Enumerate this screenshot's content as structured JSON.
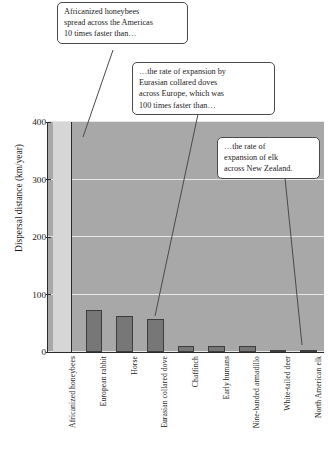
{
  "chart_data": {
    "type": "bar",
    "title": "",
    "subtitle": "",
    "xlabel": "",
    "ylabel": "Dispersal distance (km/year)",
    "ylim": [
      0,
      400
    ],
    "yticks": [
      "0",
      "100",
      "200",
      "300",
      "400"
    ],
    "ytick_values": [
      0,
      100,
      200,
      300,
      400
    ],
    "grid": true,
    "legend": "none",
    "note": "First bar (Africanized honeybees) extends beyond the top of the axis (value exceeds 400 km/year).",
    "categories": [
      "Africanized honeybees",
      "European rabbit",
      "Horse",
      "Eurasian collared dove",
      "Chaffinch",
      "Early humans",
      "Nine-banded armadillo",
      "White-tailed deer",
      "North American elk"
    ],
    "values": [
      430,
      73,
      62,
      57,
      10,
      10,
      10,
      3,
      2
    ],
    "bar_overflow": [
      true,
      false,
      false,
      false,
      false,
      false,
      false,
      false,
      false
    ]
  },
  "callouts": [
    {
      "id": "callout-bees",
      "lines": [
        "Africanized honeybees",
        "spread across the Americas",
        "10 times faster than…"
      ]
    },
    {
      "id": "callout-doves",
      "lines": [
        "…the rate of expansion by",
        "Eurasian collared doves",
        "across Europe, which was",
        "100 times faster than…"
      ]
    },
    {
      "id": "callout-elk",
      "lines": [
        "…the rate of",
        "expansion of elk",
        "across New Zealand."
      ]
    }
  ],
  "colors": {
    "plot_background": "#a8a8a8",
    "bar_fill": "#777777",
    "bar_edge": "#3d3d3d",
    "overflow_bar_fill": "#d6d6d6",
    "gridline": "#e6e6e6",
    "axis": "#2b2b2b",
    "callout_border": "#4a4a4a",
    "text": "#1c1c1c",
    "page_background": "#ffffff"
  }
}
